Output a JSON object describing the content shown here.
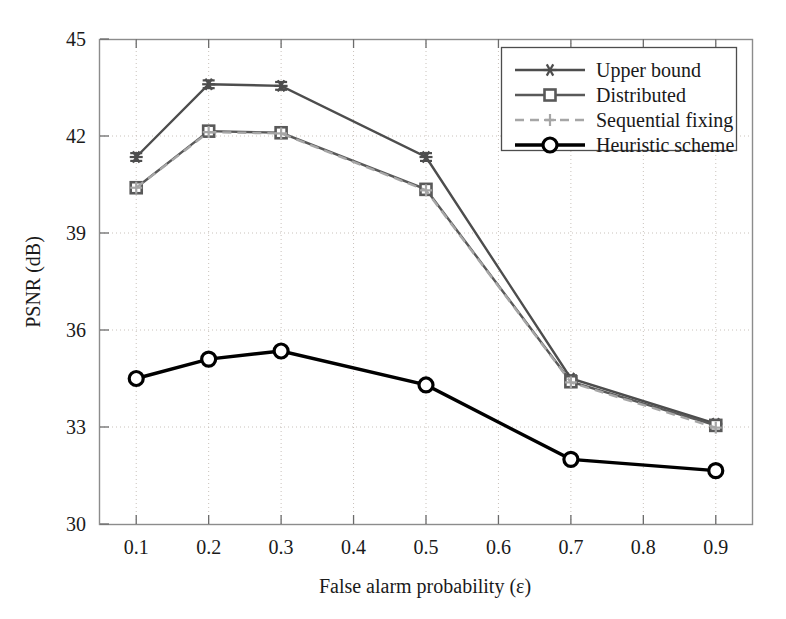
{
  "chart_data": {
    "type": "line",
    "title": "",
    "xlabel": "False alarm probability (ε)",
    "ylabel": "PSNR (dB)",
    "xlim": [
      0.05,
      0.95
    ],
    "ylim": [
      30,
      45
    ],
    "xticks": [
      "0.1",
      "0.2",
      "0.3",
      "0.4",
      "0.5",
      "0.6",
      "0.7",
      "0.8",
      "0.9"
    ],
    "xtick_values": [
      0.1,
      0.2,
      0.3,
      0.4,
      0.5,
      0.6,
      0.7,
      0.8,
      0.9
    ],
    "yticks": [
      "30",
      "33",
      "36",
      "39",
      "42",
      "45"
    ],
    "ytick_values": [
      30,
      33,
      36,
      39,
      42,
      45
    ],
    "grid": true,
    "legend_position": "upper right",
    "x": [
      0.1,
      0.2,
      0.3,
      0.5,
      0.7,
      0.9
    ],
    "series": [
      {
        "name": "Upper bound",
        "marker": "asterisk",
        "linestyle": "solid",
        "color": "#4d4d4d",
        "values": [
          41.35,
          43.6,
          43.55,
          41.35,
          34.5,
          33.1
        ],
        "errorbars": [
          0.12,
          0.12,
          0.12,
          0.12,
          0.1,
          0.08
        ]
      },
      {
        "name": "Distributed",
        "marker": "square",
        "linestyle": "solid",
        "color": "#595959",
        "values": [
          40.4,
          42.15,
          42.1,
          40.35,
          34.4,
          33.05
        ],
        "errorbars": [
          0.1,
          0.1,
          0.1,
          0.1,
          0.1,
          0.08
        ]
      },
      {
        "name": "Sequential fixing",
        "marker": "plus",
        "linestyle": "dashed",
        "color": "#a6a6a6",
        "values": [
          40.4,
          42.12,
          42.08,
          40.32,
          34.38,
          32.98
        ],
        "errorbars": [
          0,
          0,
          0,
          0,
          0,
          0
        ]
      },
      {
        "name": "Heuristic scheme",
        "marker": "circle",
        "linestyle": "solid",
        "color": "#000000",
        "values": [
          34.5,
          35.1,
          35.35,
          34.3,
          32.0,
          31.65
        ],
        "errorbars": [
          0,
          0,
          0,
          0,
          0,
          0
        ]
      }
    ]
  },
  "legend": {
    "entries": [
      {
        "label": "Upper bound"
      },
      {
        "label": "Distributed"
      },
      {
        "label": "Sequential fixing"
      },
      {
        "label": "Heuristic scheme"
      }
    ]
  },
  "axes": {
    "x_title": "False alarm probability (ε)",
    "y_title": "PSNR (dB)"
  }
}
